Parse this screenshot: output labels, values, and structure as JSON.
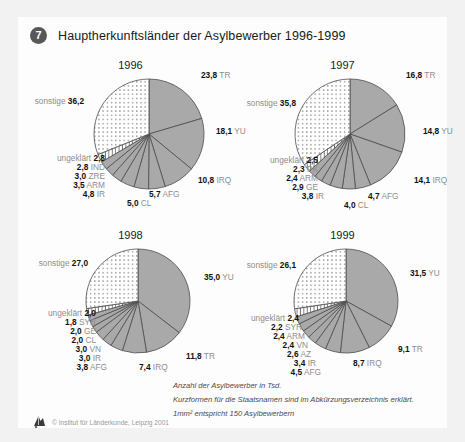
{
  "header": {
    "badge": "7",
    "title": "Hauptherkunftsländer der Asylbewerber 1996-1999"
  },
  "notes": [
    "Anzahl der Asylbewerber in Tsd.",
    "Kurzformen für die Staatsnamen sind im Abkürzungsverzeichnis erklärt.",
    "1mm² entspricht 150 Asylbewerbern"
  ],
  "credit": "© Institut für Länderkunde, Leipzig 2001",
  "colors": {
    "slice": "#a9a9a9",
    "slice_edge": "#4d4d4d",
    "pattern_bg": "#ffffff",
    "pattern_dot": "#3d3d3d",
    "label_num": "#111111",
    "label_code": "#8d8d8d",
    "badge": "#58585a",
    "panel": "#fdfdfd",
    "page": "#f2f2f2"
  },
  "chart_data": [
    {
      "type": "pie",
      "title": "1996",
      "radius_px": 55,
      "categories": [
        "TR",
        "YU",
        "IRQ",
        "AFG",
        "CL",
        "IR",
        "ARM",
        "ZRE",
        "IND",
        "ungeklärt",
        "sonstige"
      ],
      "values": [
        23.8,
        18.1,
        10.8,
        5.7,
        5.0,
        4.8,
        3.5,
        3.0,
        2.8,
        2.8,
        36.2
      ],
      "labels": [
        "23,8",
        "18,1",
        "10,8",
        "5,7",
        "5,0",
        "4,8",
        "3,5",
        "3,0",
        "2,8",
        "2,8",
        "36,2"
      ],
      "fills": [
        "solid",
        "solid",
        "solid",
        "solid",
        "solid",
        "solid",
        "solid",
        "solid",
        "solid",
        "hatch",
        "dots"
      ],
      "ylabel": "",
      "xlabel": ""
    },
    {
      "type": "pie",
      "title": "1997",
      "radius_px": 55,
      "categories": [
        "TR",
        "YU",
        "IRQ",
        "AFG",
        "CL",
        "IR",
        "GE",
        "ARM",
        "PK",
        "ungeklärt",
        "sonstige"
      ],
      "values": [
        16.8,
        14.8,
        14.1,
        4.7,
        4.0,
        3.8,
        2.9,
        2.4,
        2.3,
        2.5,
        35.8
      ],
      "labels": [
        "16,8",
        "14,8",
        "14,1",
        "4,7",
        "4,0",
        "3,8",
        "2,9",
        "2,4",
        "2,3",
        "2,5",
        "35,8"
      ],
      "fills": [
        "solid",
        "solid",
        "solid",
        "solid",
        "solid",
        "solid",
        "solid",
        "solid",
        "solid",
        "hatch",
        "dots"
      ],
      "ylabel": "",
      "xlabel": ""
    },
    {
      "type": "pie",
      "title": "1998",
      "radius_px": 52,
      "categories": [
        "YU",
        "TR",
        "IRQ",
        "AFG",
        "IR",
        "VN",
        "CL",
        "GE",
        "SYR",
        "ungeklärt",
        "sonstige"
      ],
      "values": [
        35.0,
        11.8,
        7.4,
        3.8,
        3.0,
        3.0,
        2.0,
        2.0,
        1.8,
        2.0,
        27.0
      ],
      "labels": [
        "35,0",
        "11,8",
        "7,4",
        "3,8",
        "3,0",
        "3,0",
        "2,0",
        "2,0",
        "1,8",
        "2,0",
        "27,0"
      ],
      "fills": [
        "solid",
        "solid",
        "solid",
        "solid",
        "solid",
        "solid",
        "solid",
        "solid",
        "solid",
        "hatch",
        "dots"
      ],
      "ylabel": "",
      "xlabel": ""
    },
    {
      "type": "pie",
      "title": "1999",
      "radius_px": 52,
      "categories": [
        "YU",
        "TR",
        "IRQ",
        "AFG",
        "IR",
        "AZ",
        "VN",
        "ARM",
        "SYR",
        "ungeklärt",
        "sonstige"
      ],
      "values": [
        31.5,
        9.1,
        8.7,
        4.5,
        3.4,
        2.6,
        2.4,
        2.4,
        2.2,
        2.4,
        26.1
      ],
      "labels": [
        "31,5",
        "9,1",
        "8,7",
        "4,5",
        "3,4",
        "2,6",
        "2,4",
        "2,4",
        "2,2",
        "2,4",
        "26,1"
      ],
      "fills": [
        "solid",
        "solid",
        "solid",
        "solid",
        "solid",
        "solid",
        "solid",
        "solid",
        "solid",
        "hatch",
        "dots"
      ],
      "ylabel": "",
      "xlabel": ""
    }
  ],
  "label_layout": [
    [
      {
        "x": 175,
        "y": 12,
        "side": "r"
      },
      {
        "x": 190,
        "y": 68,
        "side": "r"
      },
      {
        "x": 172,
        "y": 117,
        "side": "r"
      },
      {
        "x": 123,
        "y": 131,
        "side": "r"
      },
      {
        "x": 101,
        "y": 140,
        "side": "r"
      },
      {
        "x": 79,
        "y": 131,
        "side": "l"
      },
      {
        "x": 79,
        "y": 122,
        "side": "l"
      },
      {
        "x": 79,
        "y": 113,
        "side": "l"
      },
      {
        "x": 79,
        "y": 104,
        "side": "l"
      },
      {
        "x": 79,
        "y": 95,
        "side": "l"
      },
      {
        "x": 58,
        "y": 38,
        "side": "l"
      }
    ],
    [
      {
        "x": 168,
        "y": 12,
        "side": "r"
      },
      {
        "x": 185,
        "y": 68,
        "side": "r"
      },
      {
        "x": 176,
        "y": 117,
        "side": "r"
      },
      {
        "x": 130,
        "y": 133,
        "side": "r"
      },
      {
        "x": 106,
        "y": 142,
        "side": "r"
      },
      {
        "x": 86,
        "y": 133,
        "side": "l"
      },
      {
        "x": 80,
        "y": 124,
        "side": "l"
      },
      {
        "x": 80,
        "y": 115,
        "side": "l"
      },
      {
        "x": 80,
        "y": 106,
        "side": "l"
      },
      {
        "x": 80,
        "y": 97,
        "side": "l"
      },
      {
        "x": 58,
        "y": 40,
        "side": "l"
      }
    ],
    [
      {
        "x": 178,
        "y": 44,
        "side": "r"
      },
      {
        "x": 160,
        "y": 123,
        "side": "r"
      },
      {
        "x": 113,
        "y": 134,
        "side": "r"
      },
      {
        "x": 81,
        "y": 134,
        "side": "l"
      },
      {
        "x": 75,
        "y": 125,
        "side": "l"
      },
      {
        "x": 75,
        "y": 116,
        "side": "l"
      },
      {
        "x": 70,
        "y": 107,
        "side": "l"
      },
      {
        "x": 70,
        "y": 98,
        "side": "l"
      },
      {
        "x": 70,
        "y": 89,
        "side": "l"
      },
      {
        "x": 70,
        "y": 80,
        "side": "l"
      },
      {
        "x": 62,
        "y": 30,
        "side": "l"
      }
    ],
    [
      {
        "x": 172,
        "y": 40,
        "side": "r"
      },
      {
        "x": 160,
        "y": 116,
        "side": "r"
      },
      {
        "x": 115,
        "y": 130,
        "side": "r"
      },
      {
        "x": 83,
        "y": 139,
        "side": "l"
      },
      {
        "x": 78,
        "y": 130,
        "side": "l"
      },
      {
        "x": 73,
        "y": 121,
        "side": "l"
      },
      {
        "x": 70,
        "y": 112,
        "side": "l"
      },
      {
        "x": 67,
        "y": 103,
        "side": "l"
      },
      {
        "x": 64,
        "y": 94,
        "side": "l"
      },
      {
        "x": 61,
        "y": 85,
        "side": "l"
      },
      {
        "x": 58,
        "y": 32,
        "side": "l"
      }
    ]
  ],
  "cells": [
    {
      "left": 8,
      "top": 42,
      "cx": 123,
      "cy": 75
    },
    {
      "left": 220,
      "top": 42,
      "cx": 112,
      "cy": 75
    },
    {
      "left": 8,
      "top": 212,
      "cx": 112,
      "cy": 72
    },
    {
      "left": 220,
      "top": 212,
      "cx": 108,
      "cy": 72
    }
  ]
}
